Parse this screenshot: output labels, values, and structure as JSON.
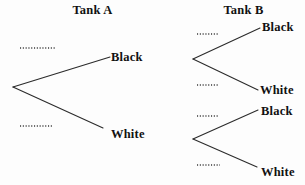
{
  "figure": {
    "type": "probability-tree-diagram",
    "tank_a": {
      "title": "Tank A",
      "branches": [
        {
          "label": "Black",
          "probability_blank": true
        },
        {
          "label": "White",
          "probability_blank": true
        }
      ]
    },
    "tank_b": {
      "title": "Tank B",
      "trees": [
        {
          "branches": [
            {
              "label": "Black",
              "probability_blank": true
            },
            {
              "label": "White",
              "probability_blank": true
            }
          ]
        },
        {
          "branches": [
            {
              "label": "Black",
              "probability_blank": true
            },
            {
              "label": "White",
              "probability_blank": true
            }
          ]
        }
      ]
    },
    "colors": {
      "line": "#2b2b2b",
      "text": "#111111",
      "background": "#fdfdfd"
    }
  }
}
